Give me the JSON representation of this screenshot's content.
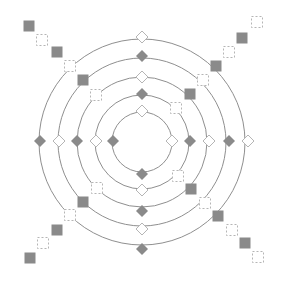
{
  "diagram": {
    "type": "concentric-rings-with-markers",
    "canvas": {
      "width": 282,
      "height": 285,
      "background": "#ffffff"
    },
    "center": {
      "x": 142,
      "y": 142
    },
    "colors": {
      "ring_stroke": "#8f8f8f",
      "filled_marker": "#8a8a8a",
      "open_marker_stroke": "#b5b5b5"
    },
    "rings": [
      {
        "r": 30
      },
      {
        "r": 47
      },
      {
        "r": 65
      },
      {
        "r": 84
      },
      {
        "r": 103
      }
    ],
    "diamonds": [
      {
        "x": 142,
        "y": 37,
        "style": "open"
      },
      {
        "x": 142,
        "y": 56,
        "style": "filled"
      },
      {
        "x": 142,
        "y": 77,
        "style": "open"
      },
      {
        "x": 142,
        "y": 94,
        "style": "filled"
      },
      {
        "x": 142,
        "y": 111,
        "style": "open"
      },
      {
        "x": 142,
        "y": 174,
        "style": "filled"
      },
      {
        "x": 142,
        "y": 190,
        "style": "open"
      },
      {
        "x": 142,
        "y": 211,
        "style": "filled"
      },
      {
        "x": 142,
        "y": 229,
        "style": "open"
      },
      {
        "x": 142,
        "y": 249,
        "style": "filled"
      },
      {
        "x": 40,
        "y": 141,
        "style": "filled"
      },
      {
        "x": 59,
        "y": 141,
        "style": "open"
      },
      {
        "x": 77,
        "y": 141,
        "style": "filled"
      },
      {
        "x": 96,
        "y": 141,
        "style": "open"
      },
      {
        "x": 113,
        "y": 141,
        "style": "filled"
      },
      {
        "x": 172,
        "y": 141,
        "style": "open"
      },
      {
        "x": 190,
        "y": 141,
        "style": "filled"
      },
      {
        "x": 209,
        "y": 141,
        "style": "open"
      },
      {
        "x": 229,
        "y": 141,
        "style": "filled"
      },
      {
        "x": 248,
        "y": 141,
        "style": "open"
      }
    ],
    "squares": [
      {
        "x": 29,
        "y": 26,
        "style": "filled"
      },
      {
        "x": 42,
        "y": 40,
        "style": "open"
      },
      {
        "x": 57,
        "y": 52,
        "style": "filled"
      },
      {
        "x": 70,
        "y": 66,
        "style": "open"
      },
      {
        "x": 83,
        "y": 80,
        "style": "filled"
      },
      {
        "x": 96,
        "y": 95,
        "style": "open"
      },
      {
        "x": 257,
        "y": 22,
        "style": "open"
      },
      {
        "x": 242,
        "y": 38,
        "style": "filled"
      },
      {
        "x": 229,
        "y": 52,
        "style": "open"
      },
      {
        "x": 216,
        "y": 66,
        "style": "filled"
      },
      {
        "x": 203,
        "y": 80,
        "style": "open"
      },
      {
        "x": 190,
        "y": 94,
        "style": "filled"
      },
      {
        "x": 176,
        "y": 108,
        "style": "open"
      },
      {
        "x": 30,
        "y": 258,
        "style": "filled"
      },
      {
        "x": 43,
        "y": 243,
        "style": "open"
      },
      {
        "x": 57,
        "y": 230,
        "style": "filled"
      },
      {
        "x": 70,
        "y": 215,
        "style": "open"
      },
      {
        "x": 83,
        "y": 202,
        "style": "filled"
      },
      {
        "x": 97,
        "y": 188,
        "style": "open"
      },
      {
        "x": 258,
        "y": 257,
        "style": "open"
      },
      {
        "x": 245,
        "y": 243,
        "style": "filled"
      },
      {
        "x": 232,
        "y": 230,
        "style": "open"
      },
      {
        "x": 218,
        "y": 216,
        "style": "filled"
      },
      {
        "x": 205,
        "y": 203,
        "style": "open"
      },
      {
        "x": 191,
        "y": 189,
        "style": "filled"
      },
      {
        "x": 178,
        "y": 176,
        "style": "open"
      }
    ],
    "marker_size": {
      "diamond": 12,
      "square": 11
    }
  }
}
